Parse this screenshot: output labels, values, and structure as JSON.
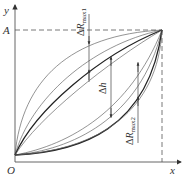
{
  "diagram": {
    "axes": {
      "x_label": "x",
      "y_label": "y",
      "origin_label": "O",
      "a_label": "A"
    },
    "annotations": {
      "dr_max1": {
        "delta": "Δ",
        "symbol": "R",
        "subscript": "max1"
      },
      "dh": {
        "delta": "Δ",
        "symbol": "h"
      },
      "dr_max2": {
        "delta": "Δ",
        "symbol": "R",
        "subscript": "max2"
      }
    },
    "colors": {
      "line": "#333333",
      "thin_line": "#666666",
      "background": "#ffffff"
    }
  }
}
